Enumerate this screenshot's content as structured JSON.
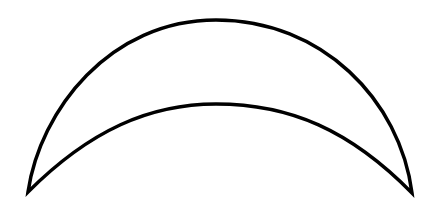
{
  "figure": {
    "shape": "crescent-outline",
    "stroke_color": "#000000",
    "fill_color": "#ffffff",
    "background_color": "#ffffff",
    "stroke_width": 3.5,
    "left_tip": [
      28,
      192
    ],
    "right_tip": [
      412,
      193
    ],
    "outer_arc_peak": [
      216,
      20
    ],
    "inner_arc_peak": [
      216,
      104
    ]
  }
}
